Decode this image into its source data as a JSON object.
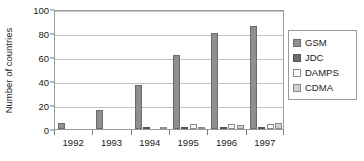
{
  "chart_data": {
    "type": "bar",
    "title": "",
    "xlabel": "",
    "ylabel": "Number of countries",
    "categories": [
      "1992",
      "1993",
      "1994",
      "1995",
      "1996",
      "1997"
    ],
    "ylim": [
      0,
      100
    ],
    "yticks": [
      0,
      20,
      40,
      60,
      80,
      100
    ],
    "ytick_labels": [
      "0",
      "20",
      "40",
      "60",
      "80",
      "100"
    ],
    "grid": true,
    "legend_position": "right",
    "series": [
      {
        "name": "GSM",
        "color": "#8f8f8f",
        "values": [
          5,
          16,
          37,
          62,
          80,
          86
        ]
      },
      {
        "name": "JDC",
        "color": "#6e6e6e",
        "values": [
          0,
          0,
          1,
          1,
          1,
          1
        ]
      },
      {
        "name": "DAMPS",
        "color": "#fbfbfb",
        "values": [
          0,
          0,
          0,
          4,
          4,
          4
        ]
      },
      {
        "name": "CDMA",
        "color": "#cfcfcf",
        "values": [
          0,
          0,
          1,
          2,
          3,
          5
        ]
      }
    ]
  }
}
